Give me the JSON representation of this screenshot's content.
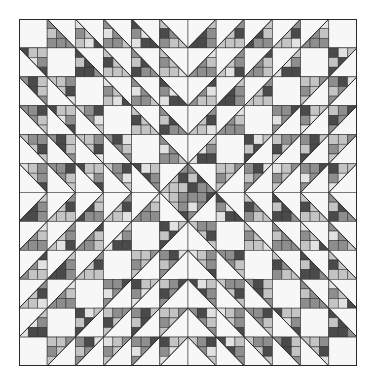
{
  "image": {
    "subject": "quilt-pattern",
    "grid": {
      "rows": 12,
      "cols": 12
    },
    "colors": {
      "background": "#ffffff",
      "white_patch": "#f7f7f7",
      "line": "#2a2a2a",
      "light_gray": "#c4c4c4",
      "mid_gray": "#8e8e8e",
      "dark_gray": "#4a4a4a",
      "very_light": "#e2e2e2"
    }
  }
}
